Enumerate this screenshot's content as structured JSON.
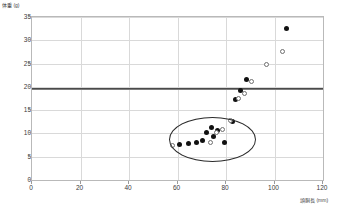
{
  "chart_data": {
    "type": "scatter",
    "title": "",
    "ylabel": "体重 (g)",
    "xlabel": "頭胴長 (mm)",
    "xlim": [
      0,
      120
    ],
    "ylim": [
      0,
      35
    ],
    "xticks": [
      0,
      20,
      40,
      60,
      80,
      100,
      120
    ],
    "yticks": [
      0,
      5,
      10,
      15,
      20,
      25,
      30,
      35
    ],
    "grid": true,
    "legend": "none",
    "annotations": [
      {
        "kind": "hline",
        "name": "maturity-threshold-line",
        "y": 19.7,
        "color": "#4a4a4a"
      },
      {
        "kind": "ellipse",
        "name": "juvenile-cluster-ellipse",
        "cx": 74,
        "cy": 9.0,
        "rx": 17.5,
        "ry": 4.6,
        "color": "#2b2b2b"
      }
    ],
    "series": [
      {
        "name": "filled",
        "marker": "filled-circle",
        "color": "#111111",
        "points": [
          {
            "x": 105.0,
            "y": 32.6
          },
          {
            "x": 88.5,
            "y": 21.6
          },
          {
            "x": 86.0,
            "y": 19.3
          },
          {
            "x": 84.0,
            "y": 17.3
          },
          {
            "x": 82.5,
            "y": 12.6
          },
          {
            "x": 79.5,
            "y": 8.1
          },
          {
            "x": 76.5,
            "y": 10.6
          },
          {
            "x": 75.0,
            "y": 9.4
          },
          {
            "x": 74.0,
            "y": 11.3
          },
          {
            "x": 72.0,
            "y": 10.1
          },
          {
            "x": 70.5,
            "y": 8.4
          },
          {
            "x": 68.0,
            "y": 8.1
          },
          {
            "x": 64.5,
            "y": 7.9
          },
          {
            "x": 61.0,
            "y": 7.6
          }
        ]
      },
      {
        "name": "open",
        "marker": "open-circle",
        "color": "#6f6f6f",
        "points": [
          {
            "x": 103.5,
            "y": 27.6
          },
          {
            "x": 96.5,
            "y": 24.9
          },
          {
            "x": 90.5,
            "y": 21.1
          },
          {
            "x": 87.5,
            "y": 18.6
          },
          {
            "x": 85.0,
            "y": 17.4
          },
          {
            "x": 82.0,
            "y": 12.8
          },
          {
            "x": 78.5,
            "y": 10.9
          },
          {
            "x": 76.0,
            "y": 10.2
          },
          {
            "x": 73.5,
            "y": 8.0
          },
          {
            "x": 58.0,
            "y": 7.4
          }
        ]
      }
    ]
  }
}
